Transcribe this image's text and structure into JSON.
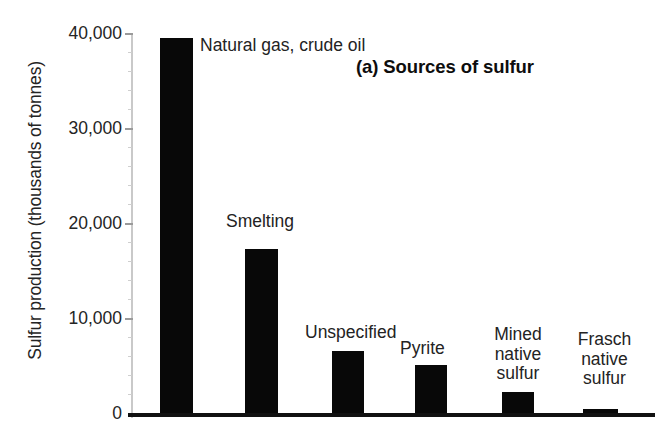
{
  "chart_data": {
    "type": "bar",
    "title": "(a) Sources of sulfur",
    "xlabel": "",
    "ylabel": "Sulfur production (thousands of tonnes)",
    "ylim": [
      0,
      40000
    ],
    "yticks": [
      0,
      10000,
      20000,
      30000,
      40000
    ],
    "ytick_labels": [
      "0",
      "10,000",
      "20,000",
      "30,000",
      "40,000"
    ],
    "grid": false,
    "legend": "none",
    "bar_color": "#080808",
    "categories": [
      "Natural gas, crude oil",
      "Smelting",
      "Unspecified",
      "Pyrite",
      "Mined native sulfur",
      "Frasch native sulfur"
    ],
    "values": [
      39500,
      17300,
      6500,
      5000,
      2200,
      400
    ]
  },
  "axis": {
    "y_title": "Sulfur production (thousands of tonnes)",
    "tick_0": "0",
    "tick_10k": "10,000",
    "tick_20k": "20,000",
    "tick_30k": "30,000",
    "tick_40k": "40,000"
  },
  "title": {
    "panel_label": "(a) Sources of sulfur"
  },
  "bar_labels": {
    "b0_line1": "Natural gas, crude oil",
    "b1_line1": "Smelting",
    "b2_line1": "Unspecified",
    "b3_line1": "Pyrite",
    "b4_line1": "Mined",
    "b4_line2": "native",
    "b4_line3": "sulfur",
    "b5_line1": "Frasch",
    "b5_line2": "native",
    "b5_line3": "sulfur"
  }
}
